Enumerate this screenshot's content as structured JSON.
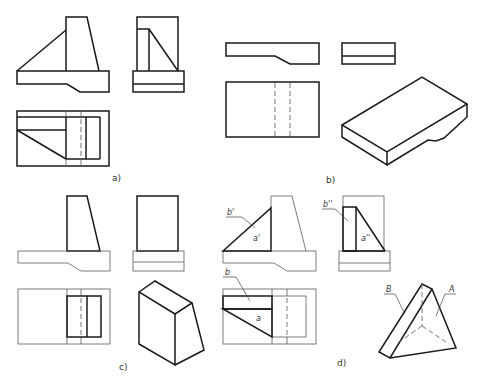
{
  "figure": {
    "panels": [
      {
        "id": "a",
        "caption": "a)",
        "content": "Three views (front, side, top) of complete part"
      },
      {
        "id": "b",
        "caption": "b)",
        "content": "Base plate: front, side, top views and isometric"
      },
      {
        "id": "c",
        "caption": "c)",
        "content": "Tapered upright block: views and isometric"
      },
      {
        "id": "d",
        "caption": "d)",
        "content": "Triangular rib: views with face labels and isometric"
      }
    ],
    "labels": {
      "b_front": "b'",
      "a_front": "a'",
      "b_side": "b''",
      "a_side": "a''",
      "b_top": "b",
      "a_top": "a",
      "iso_B": "B",
      "iso_A": "A"
    },
    "colors": {
      "line": "#1a1a1a",
      "thin_line": "#5a5a5a",
      "background": "#ffffff"
    }
  }
}
